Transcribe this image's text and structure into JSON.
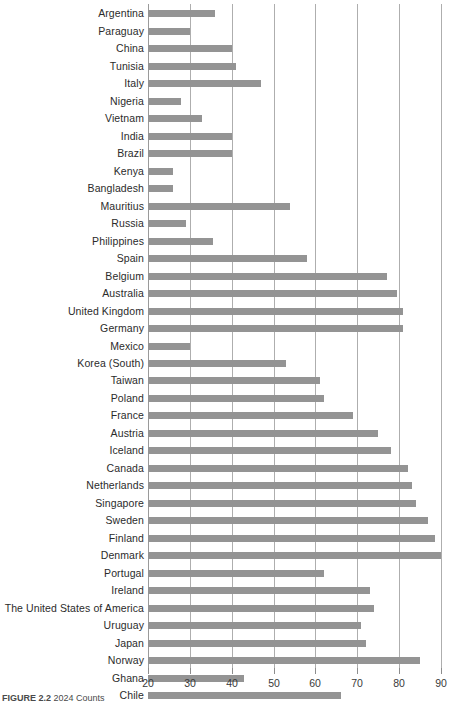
{
  "chart_data": {
    "type": "bar",
    "orientation": "horizontal",
    "title": "",
    "subtitle": "",
    "xlabel": "",
    "ylabel": "",
    "xlim": [
      20,
      90
    ],
    "xticks": [
      20,
      30,
      40,
      50,
      60,
      70,
      80,
      90
    ],
    "xtick_labels": [
      "20",
      "30",
      "40",
      "50",
      "60",
      "70",
      "80",
      "90"
    ],
    "grid": true,
    "legend": "none",
    "bar_color": "#949494",
    "gridline_color": "#aeaeae",
    "categories": [
      "Argentina",
      "Paraguay",
      "China",
      "Tunisia",
      "Italy",
      "Nigeria",
      "Vietnam",
      "India",
      "Brazil",
      "Kenya",
      "Bangladesh",
      "Mauritius",
      "Russia",
      "Philippines",
      "Spain",
      "Belgium",
      "Australia",
      "United Kingdom",
      "Germany",
      "Mexico",
      "Korea (South)",
      "Taiwan",
      "Poland",
      "France",
      "Austria",
      "Iceland",
      "Canada",
      "Netherlands",
      "Singapore",
      "Sweden",
      "Finland",
      "Denmark",
      "Portugal",
      "Ireland",
      "The United States of America",
      "Uruguay",
      "Japan",
      "Norway",
      "Ghana",
      "Chile"
    ],
    "values": [
      36,
      30,
      40,
      41,
      47,
      28,
      33,
      40,
      40,
      26,
      26,
      54,
      29,
      35.5,
      58,
      77,
      79.5,
      81,
      81,
      30,
      53,
      61,
      62,
      69,
      75,
      78,
      82,
      83,
      84,
      87,
      88.5,
      90,
      62,
      73,
      74,
      71,
      72,
      85,
      43,
      66
    ]
  },
  "caption": {
    "figure_number": "FIGURE 2.2",
    "text": "2024 Counts"
  }
}
